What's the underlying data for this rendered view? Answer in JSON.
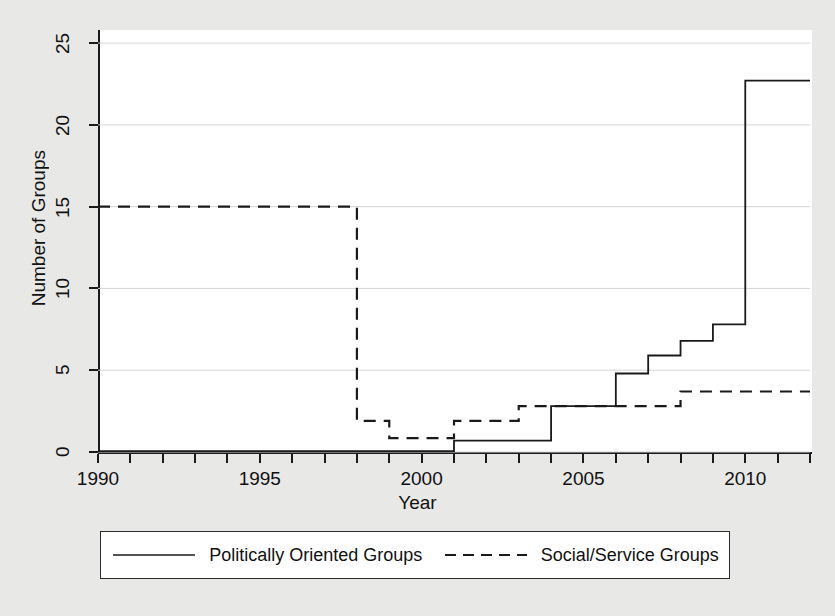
{
  "figure": {
    "background_color": "#e8e8e7",
    "plot_background_color": "#ffffff",
    "axis_color": "#1a1a1a",
    "grid_color": "#d6d6d6"
  },
  "axes": {
    "xlabel": "Year",
    "ylabel": "Number of Groups",
    "x_tick_labels": [
      "1990",
      "1995",
      "2000",
      "2005",
      "2010"
    ],
    "x_tick_values": [
      1990,
      1995,
      2000,
      2005,
      2010
    ],
    "y_tick_labels": [
      "0",
      "5",
      "10",
      "15",
      "20",
      "25"
    ],
    "y_tick_values": [
      0,
      5,
      10,
      15,
      20,
      25
    ],
    "x_minor_tick_values": [
      1990,
      1991,
      1992,
      1993,
      1994,
      1995,
      1996,
      1997,
      1998,
      1999,
      2000,
      2001,
      2002,
      2003,
      2004,
      2005,
      2006,
      2007,
      2008,
      2009,
      2010,
      2011,
      2012
    ],
    "xlim": [
      1990,
      2012
    ],
    "ylim": [
      0,
      25.8
    ],
    "grid": "horizontal"
  },
  "legend": {
    "position": "below-axes",
    "entries": [
      {
        "label": "Politically Oriented Groups",
        "style": "solid",
        "key_name": "legend-key-solid"
      },
      {
        "label": "Social/Service Groups",
        "style": "dashed",
        "key_name": "legend-key-dashed"
      }
    ]
  },
  "chart_data": {
    "type": "line",
    "subtype": "step-post",
    "title": "",
    "xlabel": "Year",
    "ylabel": "Number of Groups",
    "xlim": [
      1990,
      2012
    ],
    "ylim": [
      0,
      25.8
    ],
    "grid": true,
    "legend_position": "bottom",
    "x": [
      1990,
      1991,
      1992,
      1993,
      1994,
      1995,
      1996,
      1997,
      1998,
      1999,
      2000,
      2001,
      2002,
      2003,
      2004,
      2005,
      2006,
      2007,
      2008,
      2009,
      2010,
      2011,
      2012
    ],
    "series": [
      {
        "name": "Politically Oriented Groups",
        "style": "solid",
        "color": "#1a1a1a",
        "values": [
          0.05,
          0.05,
          0.05,
          0.05,
          0.05,
          0.05,
          0.05,
          0.05,
          0.05,
          0.05,
          0.05,
          0.7,
          0.7,
          0.7,
          2.8,
          2.8,
          4.8,
          5.9,
          6.8,
          7.8,
          22.7,
          22.7,
          22.7
        ]
      },
      {
        "name": "Social/Service Groups",
        "style": "dashed",
        "color": "#1a1a1a",
        "values": [
          15,
          15,
          15,
          15,
          15,
          15,
          15,
          15,
          1.9,
          0.85,
          0.85,
          1.9,
          1.9,
          2.8,
          2.8,
          2.8,
          2.8,
          2.8,
          3.7,
          3.7,
          3.7,
          3.7,
          3.7
        ]
      }
    ]
  }
}
